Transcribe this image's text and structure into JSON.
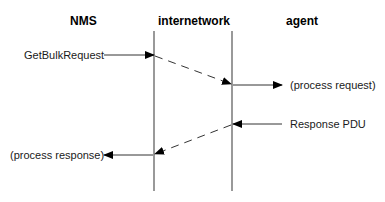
{
  "headers": {
    "nms": "NMS",
    "internetwork": "internetwork",
    "agent": "agent"
  },
  "messages": {
    "get_bulk_request": "GetBulkRequest",
    "process_request": "(process request)",
    "response_pdu": "Response PDU",
    "process_response": "(process response)"
  },
  "colors": {
    "line": "#555555",
    "arrow": "#000000",
    "text": "#1a1a1a"
  }
}
